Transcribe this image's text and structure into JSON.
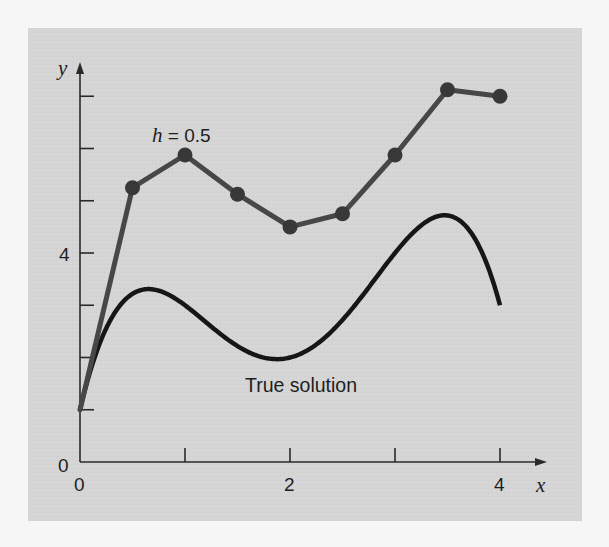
{
  "chart_data": {
    "type": "line",
    "title": "",
    "xlabel": "x",
    "ylabel": "y",
    "xlim": [
      0,
      4.4
    ],
    "ylim": [
      0,
      7.6
    ],
    "grid": false,
    "x_ticks": [
      0,
      1,
      2,
      3,
      4
    ],
    "x_tick_labels": [
      "0",
      "",
      "2",
      "",
      "4"
    ],
    "y_ticks": [
      1,
      2,
      3,
      4,
      5,
      6,
      7
    ],
    "y_tick_labels": [
      "",
      "",
      "",
      "4",
      "",
      "",
      ""
    ],
    "origin_label_y": "0",
    "series": [
      {
        "name": "h = 0.5",
        "label_prefix": "h",
        "label_suffix": " = 0.5",
        "style": "line-with-markers",
        "color": "#474747",
        "marker_color": "#383838",
        "x": [
          0,
          0.5,
          1.0,
          1.5,
          2.0,
          2.5,
          3.0,
          3.5,
          4.0
        ],
        "values": [
          1.0,
          5.25,
          5.875,
          5.125,
          4.5,
          4.75,
          5.875,
          7.125,
          7.0
        ]
      },
      {
        "name": "True solution",
        "style": "smooth-line",
        "color": "#161616",
        "formula": "y = -0.5x^4 + 4x^3 - 10x^2 + 8.5x + 1",
        "x": [
          0,
          0.25,
          0.5,
          0.75,
          1.0,
          1.25,
          1.5,
          1.75,
          2.0,
          2.25,
          2.5,
          2.75,
          3.0,
          3.25,
          3.5,
          3.75,
          4.0
        ],
        "values": [
          1.0,
          2.5605,
          3.2188,
          3.2832,
          3.0,
          2.5527,
          2.0625,
          1.5879,
          1.125,
          0.7168,
          0.6563,
          1.1269,
          2.25,
          4.0918,
          4.7188,
          4.7402,
          3.0
        ]
      }
    ],
    "annotations": [
      {
        "text": "h = 0.5",
        "near_series": "h = 0.5"
      },
      {
        "text": "True solution",
        "near_series": "True solution"
      }
    ],
    "colors": {
      "panel_background": "#d5d5d5",
      "page_background": "#f6f6f6",
      "axis": "#2a2a2a",
      "text": "#1e1e1e"
    }
  },
  "labels": {
    "y_axis": "y",
    "x_axis": "x",
    "y_zero": "0",
    "y_four": "4",
    "x_zero": "0",
    "x_two": "2",
    "x_four": "4",
    "h_var": "h",
    "h_value": " = 0.5",
    "true_solution": "True solution"
  }
}
